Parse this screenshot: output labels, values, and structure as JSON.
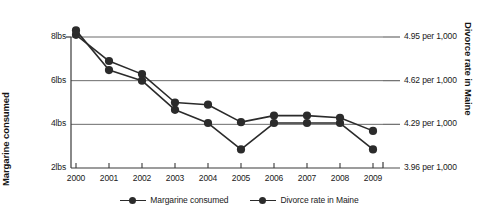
{
  "axes": {
    "y_left_title": "Margarine consumed",
    "y_right_title": "Divorce rate in Maine",
    "y_left_ticks": [
      "8lbs",
      "6lbs",
      "4lbs",
      "2lbs"
    ],
    "y_right_ticks": [
      "4.95 per 1,000",
      "4.62 per 1,000",
      "4.29 per 1,000",
      "3.96 per 1,000"
    ],
    "x_ticks": [
      "2000",
      "2001",
      "2002",
      "2003",
      "2004",
      "2005",
      "2006",
      "2007",
      "2008",
      "2009"
    ]
  },
  "legend": {
    "items": [
      {
        "label": "Margarine consumed",
        "color": "#2b2b2b"
      },
      {
        "label": "Divorce rate in Maine",
        "color": "#2b2b2b"
      }
    ]
  },
  "colors": {
    "series": "#2b2b2b",
    "gridline": "#6b6b6b",
    "axis": "#3a3a3a",
    "background": "#ffffff"
  },
  "chart_data": {
    "type": "line",
    "title": "",
    "subtitle": "",
    "xlabel": "",
    "ylabel": "Margarine consumed",
    "y2label": "Divorce rate in Maine",
    "x": [
      2000,
      2001,
      2002,
      2003,
      2004,
      2005,
      2006,
      2007,
      2008,
      2009
    ],
    "xtick_labels": [
      "2000",
      "2001",
      "2002",
      "2003",
      "2004",
      "2005",
      "2006",
      "2007",
      "2008",
      "2009"
    ],
    "grid": true,
    "legend_position": "bottom-center",
    "ylim": [
      2,
      8.9
    ],
    "ytick_labels": [
      "8lbs",
      "6lbs",
      "4lbs",
      "2lbs"
    ],
    "yticks": [
      8,
      6,
      4,
      2
    ],
    "y2lim": [
      3.96,
      5.44
    ],
    "y2tick_labels": [
      "4.95 per 1,000",
      "4.62 per 1,000",
      "4.29 per 1,000",
      "3.96 per 1,000"
    ],
    "y2ticks": [
      4.95,
      4.62,
      4.29,
      3.96
    ],
    "series": [
      {
        "name": "Margarine consumed",
        "axis": "left",
        "unit": "lbs",
        "values": [
          8.1,
          6.9,
          6.3,
          5.0,
          4.9,
          4.1,
          4.4,
          4.4,
          4.3,
          3.7
        ]
      },
      {
        "name": "Divorce rate in Maine",
        "axis": "right",
        "unit": "per 1,000",
        "values": [
          5.0,
          4.7,
          4.62,
          4.4,
          4.3,
          4.1,
          4.3,
          4.3,
          4.3,
          4.1
        ]
      }
    ]
  }
}
